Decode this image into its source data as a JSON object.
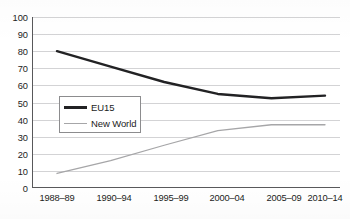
{
  "chart_data": {
    "type": "line",
    "title": "",
    "subtitle": "",
    "xlabel": "",
    "ylabel": "",
    "categories": [
      "1988–89",
      "1990–94",
      "1995–99",
      "2000–04",
      "2005–09",
      "2010–14"
    ],
    "ylim": [
      0,
      100
    ],
    "yticks": [
      0,
      10,
      20,
      30,
      40,
      50,
      60,
      70,
      80,
      90,
      100
    ],
    "ytick_labels": [
      "0",
      "10",
      "20",
      "30",
      "40",
      "50",
      "60",
      "70",
      "80",
      "90",
      "100"
    ],
    "grid": "horizontal",
    "legend_position": "inside-left",
    "series": [
      {
        "name": "EU15",
        "color": "#222224",
        "line_width": 2.4,
        "values": [
          80,
          71,
          62,
          55,
          52.5,
          54
        ]
      },
      {
        "name": "New World",
        "color": "#a6a6a8",
        "line_width": 1.3,
        "values": [
          8.5,
          16,
          25,
          33.5,
          37,
          37
        ]
      }
    ],
    "annotations": []
  },
  "legend": {
    "items": [
      {
        "label": "EU15",
        "swatch": "line-swatch-dark"
      },
      {
        "label": "New World",
        "swatch": "line-swatch-gray"
      }
    ]
  },
  "axes": {
    "x_axis_name": "period-axis",
    "y_axis_name": "value-axis"
  },
  "colors": {
    "series_eu15": "#222224",
    "series_new_world": "#a6a6a8",
    "gridline": "#d3d3d5",
    "axis": "#58585a",
    "text": "#1c1c1c",
    "background": "#ffffff"
  }
}
